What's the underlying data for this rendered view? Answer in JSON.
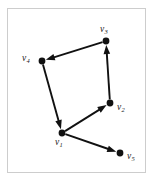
{
  "figure": {
    "type": "directed-graph-diagram",
    "frame": {
      "border_color": "#cdcdcd",
      "background_color": "#ffffff"
    },
    "ink_color": "#111111"
  },
  "graph": {
    "directed": true,
    "vertex_count": 5,
    "edge_count": 5,
    "vertices": [
      {
        "id": "v1",
        "label_v": "v",
        "label_sub": "1",
        "x": 62,
        "y": 133,
        "label_x": 55,
        "label_y": 138,
        "radius": 3.4
      },
      {
        "id": "v2",
        "label_v": "v",
        "label_sub": "2",
        "x": 110,
        "y": 103,
        "label_x": 117,
        "label_y": 103,
        "radius": 3.4
      },
      {
        "id": "v3",
        "label_v": "v",
        "label_sub": "3",
        "x": 106,
        "y": 41,
        "label_x": 100,
        "label_y": 25,
        "radius": 3.4
      },
      {
        "id": "v4",
        "label_v": "v",
        "label_sub": "4",
        "x": 42,
        "y": 61,
        "label_x": 22,
        "label_y": 54,
        "radius": 3.4
      },
      {
        "id": "v5",
        "label_v": "v",
        "label_sub": "5",
        "x": 120,
        "y": 153,
        "label_x": 127,
        "label_y": 152,
        "radius": 3.4
      }
    ],
    "edges": [
      {
        "id": "e-v3-v4",
        "from": "v3",
        "to": "v4",
        "x1": 106,
        "y1": 41,
        "x2": 42,
        "y2": 61
      },
      {
        "id": "e-v4-v1",
        "from": "v4",
        "to": "v1",
        "x1": 42,
        "y1": 61,
        "x2": 62,
        "y2": 133
      },
      {
        "id": "e-v1-v2",
        "from": "v1",
        "to": "v2",
        "x1": 62,
        "y1": 133,
        "x2": 110,
        "y2": 103
      },
      {
        "id": "e-v2-v3",
        "from": "v2",
        "to": "v3",
        "x1": 110,
        "y1": 103,
        "x2": 106,
        "y2": 41
      },
      {
        "id": "e-v1-v5",
        "from": "v1",
        "to": "v5",
        "x1": 62,
        "y1": 133,
        "x2": 120,
        "y2": 153
      }
    ]
  }
}
